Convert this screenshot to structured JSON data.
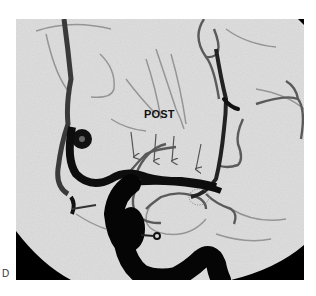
{
  "figure": {
    "panel_label": "D",
    "annotation_label": "POST",
    "arrow_count": 4,
    "colors": {
      "background": "#ffffff",
      "field": "#e2e2e2",
      "vessel": "#111111",
      "vessel_faint": "#6a6a6a",
      "collimator": "#000000"
    }
  }
}
